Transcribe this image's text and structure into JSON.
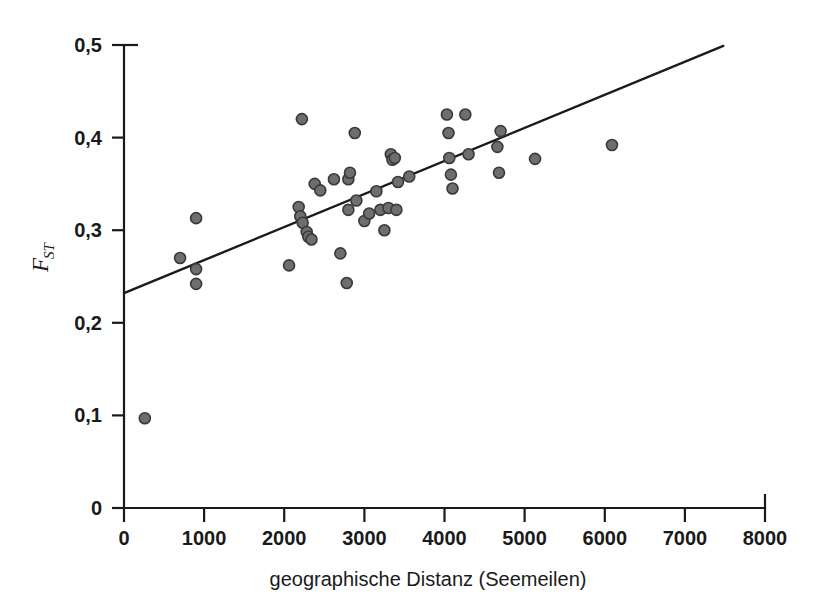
{
  "chart_data": {
    "type": "scatter",
    "title": "",
    "xlabel": "geographische Distanz (Seemeilen)",
    "ylabel": "F_ST",
    "ylabel_main": "F",
    "ylabel_sub": "ST",
    "xlim": [
      0,
      8000
    ],
    "ylim": [
      0,
      0.5
    ],
    "grid": false,
    "legend": null,
    "x_ticks": [
      0,
      1000,
      2000,
      3000,
      4000,
      5000,
      6000,
      7000,
      8000
    ],
    "x_tick_labels": [
      "0",
      "1000",
      "2000",
      "3000",
      "4000",
      "5000",
      "6000",
      "7000",
      "8000"
    ],
    "y_ticks": [
      0,
      0.1,
      0.2,
      0.3,
      0.4,
      0.5
    ],
    "y_tick_labels": [
      "0",
      "0,1",
      "0,2",
      "0,3",
      "0,4",
      "0,5"
    ],
    "point_color": "#6e6e6e",
    "point_edge_color": "#3a3a3a",
    "line_color": "#1a1a1a",
    "point_radius": 5.5,
    "series": [
      {
        "name": "Populationspaare",
        "x": [
          260,
          700,
          900,
          900,
          900,
          2060,
          2180,
          2200,
          2220,
          2230,
          2280,
          2300,
          2340,
          2380,
          2450,
          2620,
          2700,
          2780,
          2800,
          2800,
          2820,
          2880,
          2900,
          3000,
          3060,
          3150,
          3200,
          3250,
          3300,
          3330,
          3350,
          3380,
          3400,
          3420,
          3560,
          4030,
          4050,
          4060,
          4080,
          4100,
          4260,
          4300,
          4660,
          4680,
          4700,
          5130,
          6090
        ],
        "y": [
          0.097,
          0.27,
          0.313,
          0.258,
          0.242,
          0.262,
          0.325,
          0.315,
          0.42,
          0.308,
          0.298,
          0.293,
          0.29,
          0.35,
          0.343,
          0.355,
          0.275,
          0.243,
          0.355,
          0.322,
          0.362,
          0.405,
          0.332,
          0.31,
          0.318,
          0.342,
          0.322,
          0.3,
          0.324,
          0.382,
          0.376,
          0.378,
          0.322,
          0.352,
          0.358,
          0.425,
          0.405,
          0.378,
          0.36,
          0.345,
          0.425,
          0.382,
          0.39,
          0.362,
          0.407,
          0.377,
          0.392
        ]
      }
    ],
    "trendline": {
      "name": "Regressionsgerade",
      "x_start": 0,
      "y_start": 0.232,
      "x_end": 7480,
      "y_end": 0.499
    }
  },
  "axes": {
    "x_axis_name": "x-axis",
    "y_axis_name": "y-axis"
  }
}
